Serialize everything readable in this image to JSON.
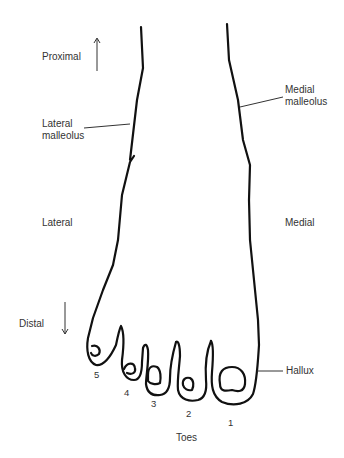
{
  "diagram": {
    "colors": {
      "outline": "#111111",
      "text": "#333333",
      "leader": "#333333",
      "background": "#ffffff"
    },
    "labels": {
      "proximal": "Proximal",
      "distal": "Distal",
      "lateral_malleolus_1": "Lateral",
      "lateral_malleolus_2": "malleolus",
      "medial_malleolus_1": "Medial",
      "medial_malleolus_2": "malleolus",
      "lateral": "Lateral",
      "medial": "Medial",
      "hallux": "Hallux",
      "toes": "Toes"
    },
    "toe_numbers": [
      "5",
      "4",
      "3",
      "2",
      "1"
    ],
    "arrows": [
      {
        "name": "proximal-arrow",
        "direction": "up"
      },
      {
        "name": "distal-arrow",
        "direction": "down"
      }
    ]
  }
}
